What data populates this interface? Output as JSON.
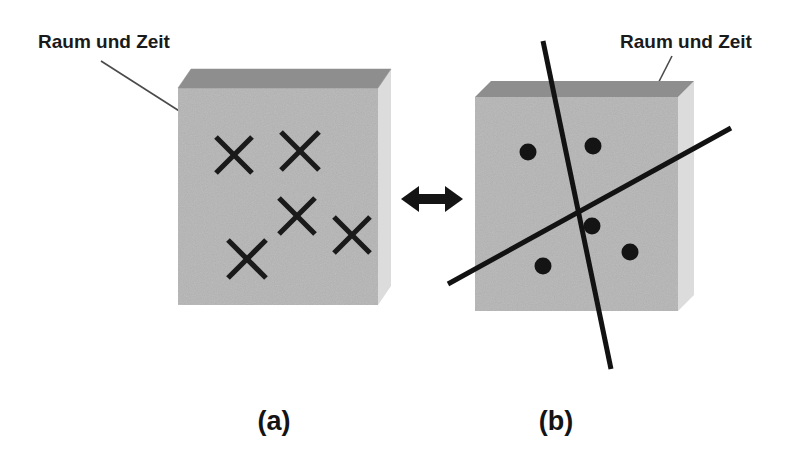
{
  "figure": {
    "title_alt": "Raum und Zeit",
    "background_color": "#ffffff",
    "width": 797,
    "height": 467
  },
  "panels": [
    {
      "id": "a",
      "caption": "(a)",
      "caption_position": {
        "x": 274,
        "y": 430
      },
      "annotation_label": "Raum und Zeit",
      "annotation_position": {
        "x": 38,
        "y": 48
      },
      "leader_line": {
        "x1": 101,
        "y1": 61,
        "x2": 184,
        "y2": 114
      },
      "slab": {
        "front_face_color": "#b5b5b5",
        "top_face_color": "#8e8e8e",
        "side_face_color": "#dcdcdc",
        "front": {
          "x": 178,
          "y": 88,
          "width": 200,
          "height": 217
        },
        "depth_x": 13,
        "depth_y": 19
      },
      "marker_type": "x-cross",
      "marker_label": "Ereignis (Kreuz)",
      "markers": [
        {
          "cx": 234,
          "cy": 155,
          "r": 20
        },
        {
          "cx": 300,
          "cy": 151,
          "r": 20
        },
        {
          "cx": 297,
          "cy": 216,
          "r": 20
        },
        {
          "cx": 247,
          "cy": 259,
          "r": 20
        },
        {
          "cx": 352,
          "cy": 235,
          "r": 20
        }
      ]
    },
    {
      "id": "b",
      "caption": "(b)",
      "caption_position": {
        "x": 556,
        "y": 430
      },
      "annotation_label": "Raum und Zeit",
      "annotation_position": {
        "x": 620,
        "y": 48
      },
      "leader_line": {
        "x1": 672,
        "y1": 56,
        "x2": 643,
        "y2": 113
      },
      "slab": {
        "front_face_color": "#b5b5b5",
        "top_face_color": "#8e8e8e",
        "side_face_color": "#dcdcdc",
        "front": {
          "x": 475,
          "y": 97,
          "width": 203,
          "height": 214
        },
        "depth_x": 16,
        "depth_y": 16
      },
      "marker_type": "dot",
      "marker_label": "Ereignis (Punkt)",
      "markers": [
        {
          "cx": 528,
          "cy": 152,
          "r": 8.5
        },
        {
          "cx": 593,
          "cy": 146,
          "r": 8.5
        },
        {
          "cx": 592,
          "cy": 226,
          "r": 8.5
        },
        {
          "cx": 543,
          "cy": 266,
          "r": 8.5
        },
        {
          "cx": 630,
          "cy": 252,
          "r": 8.5
        }
      ],
      "lines_label": "Weltlinien",
      "lines": [
        {
          "name": "steep-line",
          "x1": 543,
          "y1": 41,
          "x2": 611,
          "y2": 369
        },
        {
          "name": "shallow-line",
          "x1": 448,
          "y1": 284,
          "x2": 731,
          "y2": 128
        }
      ]
    }
  ],
  "connector": {
    "name": "double-headed-arrow",
    "label": "aequivalent",
    "x_start": 401,
    "x_end": 463,
    "y": 199,
    "color": "#141414"
  }
}
